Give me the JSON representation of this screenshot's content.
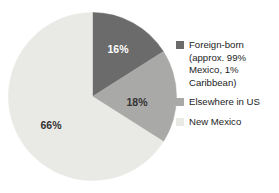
{
  "chart_data": {
    "type": "pie",
    "title": "",
    "subtitle": "",
    "xlabel": "",
    "ylabel": "",
    "legend_position": "right",
    "grid": false,
    "start_angle_deg": 0,
    "direction": "clockwise",
    "categories": [
      "Foreign-born (approx. 99% Mexico, 1% Caribbean)",
      "Elsewhere in US",
      "New Mexico"
    ],
    "values": [
      16,
      18,
      66
    ],
    "value_unit": "%",
    "slices": [
      {
        "label": "Foreign-born (approx. 99% Mexico, 1% Caribbean)",
        "legend_label": "Foreign-born\n(approx. 99%\nMexico, 1%\nCaribbean)",
        "value": 16,
        "data_label": "16%",
        "color": "#6b6b6b",
        "label_color": "#ffffff",
        "label_x": 118,
        "label_y": 50
      },
      {
        "label": "Elsewhere in US",
        "legend_label": "Elsewhere in US",
        "value": 18,
        "data_label": "18%",
        "color": "#a9a9a7",
        "label_color": "#333333",
        "label_x": 137,
        "label_y": 103
      },
      {
        "label": "New Mexico",
        "legend_label": "New Mexico",
        "value": 66,
        "data_label": "66%",
        "color": "#e9e9e6",
        "label_color": "#333333",
        "label_x": 51,
        "label_y": 126
      }
    ]
  },
  "legend": {
    "items": [
      {
        "label": "Foreign-born\n(approx. 99%\nMexico, 1%\nCaribbean)",
        "color": "#6b6b6b"
      },
      {
        "label": "Elsewhere in US",
        "color": "#a9a9a7"
      },
      {
        "label": "New Mexico",
        "color": "#e9e9e6"
      }
    ]
  },
  "colors": {
    "background": "#ffffff",
    "foreign_born": "#6b6b6b",
    "elsewhere_in_us": "#a9a9a7",
    "new_mexico": "#e9e9e6",
    "text": "#1c1c1c"
  }
}
